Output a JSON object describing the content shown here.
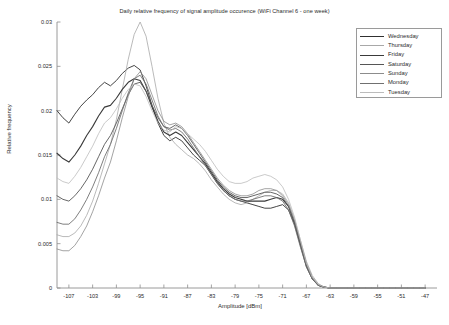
{
  "chart_data": {
    "type": "line",
    "title": "Daily relative frequency of signal amplitude occurence (WiFi Channel 6 - one week)",
    "xlabel": "Amplitude [dBm]",
    "ylabel": "Relative frequency",
    "grid": false,
    "legend_position": "top-right",
    "xlim": [
      -109,
      -45
    ],
    "ylim": [
      0,
      0.03
    ],
    "xticks": [
      -107,
      -103,
      -99,
      -95,
      -91,
      -87,
      -83,
      -79,
      -75,
      -71,
      -67,
      -63,
      -59,
      -55,
      -51,
      -47
    ],
    "xtick_labels": [
      "-107",
      "-103",
      "-99",
      "-95",
      "-91",
      "-87",
      "-83",
      "-79",
      "-75",
      "-71",
      "-67",
      "-63",
      "-59",
      "-55",
      "-51",
      "-47"
    ],
    "yticks": [
      0,
      0.005,
      0.01,
      0.015,
      0.02,
      0.025,
      0.03
    ],
    "ytick_labels": [
      "0",
      "0.005",
      "0.01",
      "0.015",
      "0.02",
      "0.025",
      "0.03"
    ],
    "x": [
      -109,
      -108,
      -107,
      -106,
      -105,
      -104,
      -103,
      -102,
      -101,
      -100,
      -99,
      -98,
      -97,
      -96,
      -95,
      -94,
      -93,
      -92,
      -91,
      -90,
      -89,
      -88,
      -87,
      -86,
      -85,
      -84,
      -83,
      -82,
      -81,
      -80,
      -79,
      -78,
      -77,
      -76,
      -75,
      -74,
      -73,
      -72,
      -71,
      -70,
      -69,
      -68,
      -67,
      -66,
      -65,
      -64,
      -63,
      -62,
      -61,
      -60,
      -59,
      -58,
      -57,
      -56,
      -55,
      -54,
      -53,
      -52,
      -51,
      -50,
      -49,
      -48,
      -47
    ],
    "series": [
      {
        "name": "Wednesday",
        "color": "#303030",
        "width": 0.9,
        "values": [
          0.02,
          0.0192,
          0.0186,
          0.0196,
          0.0205,
          0.0212,
          0.0218,
          0.0226,
          0.0232,
          0.0228,
          0.0234,
          0.0242,
          0.0248,
          0.0251,
          0.0246,
          0.0228,
          0.0206,
          0.0186,
          0.0172,
          0.0166,
          0.017,
          0.0166,
          0.0158,
          0.015,
          0.0144,
          0.0138,
          0.0128,
          0.0118,
          0.011,
          0.0104,
          0.01,
          0.0098,
          0.0096,
          0.0094,
          0.0092,
          0.009,
          0.009,
          0.0092,
          0.0094,
          0.0088,
          0.0072,
          0.0048,
          0.0024,
          0.001,
          0.0003,
          0.0001,
          0,
          0,
          0,
          0,
          0,
          0,
          0,
          0,
          0,
          0,
          0,
          0,
          0,
          0,
          0,
          0,
          0
        ]
      },
      {
        "name": "Thursday",
        "color": "#a8a8a8",
        "width": 0.8,
        "values": [
          0.006,
          0.0058,
          0.0058,
          0.0062,
          0.007,
          0.0082,
          0.0098,
          0.0118,
          0.014,
          0.0162,
          0.019,
          0.0224,
          0.0258,
          0.0286,
          0.03,
          0.0284,
          0.025,
          0.0214,
          0.0186,
          0.017,
          0.0162,
          0.0156,
          0.015,
          0.0146,
          0.014,
          0.0132,
          0.0122,
          0.0114,
          0.0106,
          0.01,
          0.0096,
          0.0094,
          0.0096,
          0.01,
          0.0104,
          0.0108,
          0.011,
          0.011,
          0.0106,
          0.0096,
          0.0078,
          0.0054,
          0.003,
          0.0014,
          0.0005,
          0.0001,
          0,
          0,
          0,
          0,
          0,
          0,
          0,
          0,
          0,
          0,
          0,
          0,
          0,
          0,
          0,
          0,
          0
        ]
      },
      {
        "name": "Friday",
        "color": "#3a3a3a",
        "width": 1.1,
        "values": [
          0.0152,
          0.0146,
          0.0142,
          0.015,
          0.016,
          0.0172,
          0.0182,
          0.0194,
          0.0204,
          0.0206,
          0.0214,
          0.0224,
          0.0232,
          0.0236,
          0.0234,
          0.0222,
          0.0204,
          0.0188,
          0.0176,
          0.0172,
          0.0176,
          0.0172,
          0.0164,
          0.0156,
          0.0148,
          0.014,
          0.013,
          0.012,
          0.0112,
          0.0106,
          0.0102,
          0.01,
          0.0098,
          0.0098,
          0.0098,
          0.0098,
          0.01,
          0.0102,
          0.01,
          0.0092,
          0.0074,
          0.005,
          0.0026,
          0.0011,
          0.0003,
          0.0001,
          0,
          0,
          0,
          0,
          0,
          0,
          0,
          0,
          0,
          0,
          0,
          0,
          0,
          0,
          0,
          0,
          0
        ]
      },
      {
        "name": "Saturday",
        "color": "#565656",
        "width": 0.9,
        "values": [
          0.0104,
          0.01,
          0.0098,
          0.0104,
          0.0112,
          0.0122,
          0.0134,
          0.0148,
          0.0162,
          0.0172,
          0.0186,
          0.0202,
          0.0218,
          0.023,
          0.0232,
          0.0222,
          0.0206,
          0.0192,
          0.0182,
          0.018,
          0.0184,
          0.018,
          0.0172,
          0.0162,
          0.0152,
          0.0142,
          0.0132,
          0.0122,
          0.0114,
          0.0108,
          0.0104,
          0.0102,
          0.0102,
          0.0104,
          0.0106,
          0.0108,
          0.0108,
          0.0106,
          0.0102,
          0.0092,
          0.0074,
          0.005,
          0.0026,
          0.0011,
          0.0003,
          0.0001,
          0,
          0,
          0,
          0,
          0,
          0,
          0,
          0,
          0,
          0,
          0,
          0,
          0,
          0,
          0,
          0,
          0
        ]
      },
      {
        "name": "Sunday",
        "color": "#8c8c8c",
        "width": 0.8,
        "values": [
          0.0044,
          0.0042,
          0.0042,
          0.0048,
          0.0058,
          0.007,
          0.0086,
          0.0104,
          0.0124,
          0.0142,
          0.0166,
          0.0192,
          0.0216,
          0.0236,
          0.0244,
          0.0236,
          0.0218,
          0.02,
          0.0188,
          0.0184,
          0.0186,
          0.0182,
          0.0174,
          0.0164,
          0.0154,
          0.0144,
          0.0134,
          0.0124,
          0.0116,
          0.011,
          0.0106,
          0.0104,
          0.0104,
          0.0106,
          0.011,
          0.0112,
          0.0112,
          0.011,
          0.0104,
          0.0094,
          0.0076,
          0.0052,
          0.0028,
          0.0012,
          0.0004,
          0.0001,
          0,
          0,
          0,
          0,
          0,
          0,
          0,
          0,
          0,
          0,
          0,
          0,
          0,
          0,
          0,
          0,
          0
        ]
      },
      {
        "name": "Monday",
        "color": "#707070",
        "width": 0.9,
        "values": [
          0.0074,
          0.0072,
          0.0072,
          0.0078,
          0.0088,
          0.01,
          0.0114,
          0.013,
          0.0148,
          0.0162,
          0.018,
          0.02,
          0.022,
          0.0236,
          0.024,
          0.023,
          0.0212,
          0.0194,
          0.0182,
          0.0178,
          0.018,
          0.0176,
          0.0168,
          0.0158,
          0.0148,
          0.0138,
          0.0128,
          0.0118,
          0.011,
          0.0104,
          0.01,
          0.0098,
          0.0098,
          0.01,
          0.0102,
          0.0104,
          0.0104,
          0.0102,
          0.0098,
          0.0088,
          0.007,
          0.0046,
          0.0024,
          0.001,
          0.0003,
          0.0001,
          0,
          0,
          0,
          0,
          0,
          0,
          0,
          0,
          0,
          0,
          0,
          0,
          0,
          0,
          0,
          0,
          0
        ]
      },
      {
        "name": "Tuesday",
        "color": "#bcbcbc",
        "width": 0.8,
        "values": [
          0.0124,
          0.012,
          0.0118,
          0.0126,
          0.0136,
          0.0148,
          0.016,
          0.0174,
          0.0186,
          0.0192,
          0.0202,
          0.0214,
          0.0224,
          0.023,
          0.0228,
          0.0216,
          0.02,
          0.0186,
          0.0178,
          0.0176,
          0.0182,
          0.018,
          0.0174,
          0.0168,
          0.0162,
          0.0154,
          0.0144,
          0.0134,
          0.0126,
          0.012,
          0.0118,
          0.0118,
          0.012,
          0.0124,
          0.0126,
          0.0128,
          0.0126,
          0.0122,
          0.0114,
          0.01,
          0.008,
          0.0054,
          0.0028,
          0.0012,
          0.0004,
          0.0001,
          0,
          0,
          0,
          0,
          0,
          0,
          0,
          0,
          0,
          0,
          0,
          0,
          0,
          0,
          0,
          0,
          0
        ]
      }
    ]
  }
}
